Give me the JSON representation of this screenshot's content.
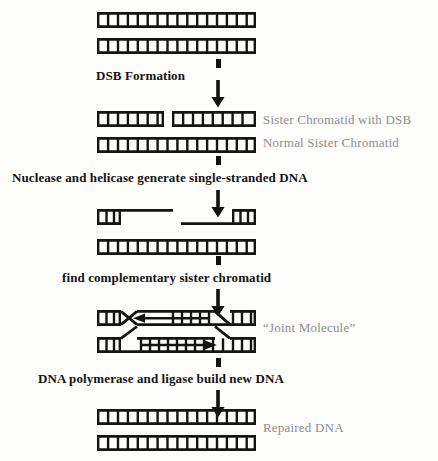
{
  "diagram": {
    "ink_color": "#141414",
    "annotation_color": "#8d8d8d",
    "background": "#fdfdfc"
  },
  "process_labels": [
    {
      "id": "dsb-formation",
      "text": "DSB Formation",
      "x": 96,
      "y": 68,
      "size": 13
    },
    {
      "id": "nuclease-helicase",
      "text": "Nuclease and helicase generate single-stranded DNA",
      "x": 12,
      "y": 170,
      "size": 13
    },
    {
      "id": "find-complementary",
      "text": "find complementary sister chromatid",
      "x": 62,
      "y": 270,
      "size": 13
    },
    {
      "id": "polymerase-ligase",
      "text": "DNA polymerase and ligase build new DNA",
      "x": 38,
      "y": 371,
      "size": 13
    }
  ],
  "annotation_labels": [
    {
      "id": "sister-chromatid-dsb",
      "text": "Sister Chromatid with DSB",
      "x": 263,
      "y": 112,
      "size": 13
    },
    {
      "id": "normal-sister-chromatid",
      "text": "Normal Sister Chromatid",
      "x": 263,
      "y": 135,
      "size": 13
    },
    {
      "id": "joint-molecule",
      "text": "“Joint Molecule”",
      "x": 263,
      "y": 320,
      "size": 13
    },
    {
      "id": "repaired-dna",
      "text": "Repaired DNA",
      "x": 263,
      "y": 420,
      "size": 13
    }
  ],
  "stages": [
    {
      "id": "intact-duplexes",
      "name": "Two intact sister chromatids",
      "y": 12,
      "strands": [
        "intact duplex",
        "intact duplex"
      ]
    },
    {
      "id": "broken-duplex",
      "name": "Sister chromatid with double-strand break",
      "y": 111,
      "strands": [
        "duplex broken into two fragments",
        "intact duplex"
      ]
    },
    {
      "id": "resected-duplex",
      "name": "Resected ends with single-stranded DNA overhangs",
      "y": 209,
      "strands": [
        "left fragment with 3' single-strand tail",
        "right fragment with single-strand tail",
        "intact duplex"
      ]
    },
    {
      "id": "joint-molecule-stage",
      "name": "Joint molecule with strand invasion and crossover",
      "y": 310,
      "strands": [
        "invading strand crossover",
        "template duplex"
      ]
    },
    {
      "id": "repaired-duplexes",
      "name": "Two repaired duplexes",
      "y": 409,
      "strands": [
        "intact duplex",
        "intact duplex"
      ]
    }
  ],
  "arrows": [
    {
      "id": "arrow-stub-1",
      "x": 216,
      "y": 59,
      "height": 9
    },
    {
      "id": "arrow-big-1",
      "x": 211,
      "y": 80,
      "height": 28
    },
    {
      "id": "arrow-stub-2",
      "x": 216,
      "y": 156,
      "height": 9
    },
    {
      "id": "arrow-big-2",
      "x": 211,
      "y": 180,
      "height": 28
    },
    {
      "id": "arrow-stub-3",
      "x": 216,
      "y": 256,
      "height": 9
    },
    {
      "id": "arrow-big-3",
      "x": 211,
      "y": 280,
      "height": 28
    },
    {
      "id": "arrow-stub-4",
      "x": 216,
      "y": 358,
      "height": 9
    },
    {
      "id": "arrow-big-4",
      "x": 211,
      "y": 381,
      "height": 28
    }
  ],
  "ladder_geometry": {
    "left_x": 97,
    "right_x": 256,
    "rung_count": 16,
    "rail_thickness": 2.6,
    "duplex_height": 13
  },
  "joint_molecule_arrows": [
    {
      "id": "leftward-synthesis-arrow",
      "direction": "left",
      "strand": "top"
    },
    {
      "id": "rightward-synthesis-arrow",
      "direction": "right",
      "strand": "bottom"
    }
  ]
}
